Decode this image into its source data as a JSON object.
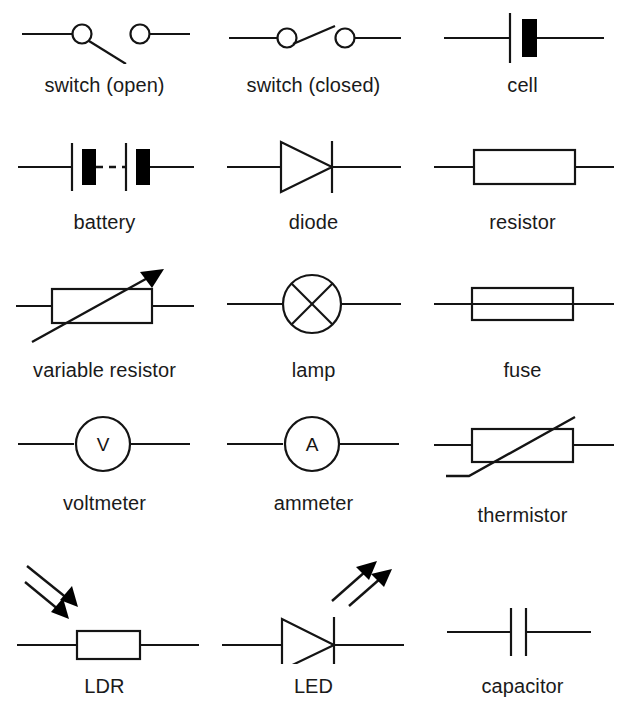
{
  "page": {
    "background_color": "#ffffff",
    "ink_color": "#141414",
    "columns": 3,
    "rows": 5,
    "symbol_count": 15
  },
  "symbols": [
    {
      "id": "switch-open",
      "label": "switch (open)",
      "icon": "switch-open-icon",
      "row": 1,
      "column": 1,
      "description": "Horizontal lead to an open circle terminal, hinged blade angled down-right, separate circle terminal with lead to the right"
    },
    {
      "id": "switch-closed",
      "label": "switch (closed)",
      "icon": "switch-closed-icon",
      "row": 1,
      "column": 2,
      "description": "Two circle terminals bridged by a slanted blade, leads on both sides"
    },
    {
      "id": "cell",
      "label": "cell",
      "icon": "cell-icon",
      "row": 1,
      "column": 3,
      "description": "Long thin vertical plate and short thick filled plate on a horizontal wire"
    },
    {
      "id": "battery",
      "label": "battery",
      "icon": "battery-icon",
      "row": 2,
      "column": 1,
      "description": "Two cells in series joined by a dashed wire"
    },
    {
      "id": "diode",
      "label": "diode",
      "icon": "diode-icon",
      "row": 2,
      "column": 2,
      "description": "Open triangle pointing right against a vertical bar on a horizontal wire"
    },
    {
      "id": "resistor",
      "label": "resistor",
      "icon": "resistor-icon",
      "row": 2,
      "column": 3,
      "description": "Open rectangle with leads at left and right"
    },
    {
      "id": "variable-resistor",
      "label": "variable resistor",
      "icon": "variable-resistor-icon",
      "row": 3,
      "column": 1,
      "description": "Resistor rectangle crossed by a diagonal arrow pointing up-right"
    },
    {
      "id": "lamp",
      "label": "lamp",
      "icon": "lamp-icon",
      "row": 3,
      "column": 2,
      "description": "Circle containing a diagonal cross, leads at left and right"
    },
    {
      "id": "fuse",
      "label": "fuse",
      "icon": "fuse-icon",
      "row": 3,
      "column": 3,
      "description": "Open rectangle with a continuous wire running through it"
    },
    {
      "id": "voltmeter",
      "label": "voltmeter",
      "icon": "voltmeter-icon",
      "row": 4,
      "column": 1,
      "letter": "V",
      "description": "Circle containing the letter V with leads at left and right"
    },
    {
      "id": "ammeter",
      "label": "ammeter",
      "icon": "ammeter-icon",
      "row": 4,
      "column": 2,
      "letter": "A",
      "description": "Circle containing the letter A with leads at left and right"
    },
    {
      "id": "thermistor",
      "label": "thermistor",
      "icon": "thermistor-icon",
      "row": 4,
      "column": 3,
      "description": "Resistor rectangle crossed by a diagonal line with a horizontal foot at the lower left"
    },
    {
      "id": "ldr",
      "label": "LDR",
      "icon": "ldr-icon",
      "row": 5,
      "column": 1,
      "description": "Resistor rectangle with two parallel arrows pointing inward toward it representing incident light"
    },
    {
      "id": "led",
      "label": "LED",
      "icon": "led-icon",
      "row": 5,
      "column": 2,
      "description": "Diode with two parallel arrows pointing outward up-right representing emitted light"
    },
    {
      "id": "capacitor",
      "label": "capacitor",
      "icon": "capacitor-icon",
      "row": 5,
      "column": 3,
      "description": "Two equal parallel vertical plates separated by a small gap on a horizontal wire"
    }
  ]
}
